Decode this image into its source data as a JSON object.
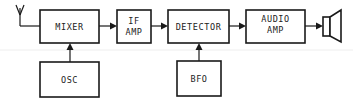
{
  "diagram": {
    "blocks": [
      {
        "id": "mixer",
        "lines": [
          "MIXER"
        ]
      },
      {
        "id": "if_amp",
        "lines": [
          "IF",
          "AMP"
        ]
      },
      {
        "id": "detector",
        "lines": [
          "DETECTOR"
        ]
      },
      {
        "id": "audio_amp",
        "lines": [
          "AUDIO",
          "AMP"
        ]
      },
      {
        "id": "osc",
        "lines": [
          "OSC"
        ]
      },
      {
        "id": "bfo",
        "lines": [
          "BFO"
        ]
      }
    ],
    "connections": [
      {
        "from": "antenna",
        "to": "mixer"
      },
      {
        "from": "mixer",
        "to": "if_amp"
      },
      {
        "from": "if_amp",
        "to": "detector"
      },
      {
        "from": "detector",
        "to": "audio_amp"
      },
      {
        "from": "audio_amp",
        "to": "speaker"
      },
      {
        "from": "osc",
        "to": "mixer"
      },
      {
        "from": "bfo",
        "to": "detector"
      }
    ],
    "icons": {
      "antenna": "antenna-icon",
      "speaker": "speaker-icon"
    }
  }
}
